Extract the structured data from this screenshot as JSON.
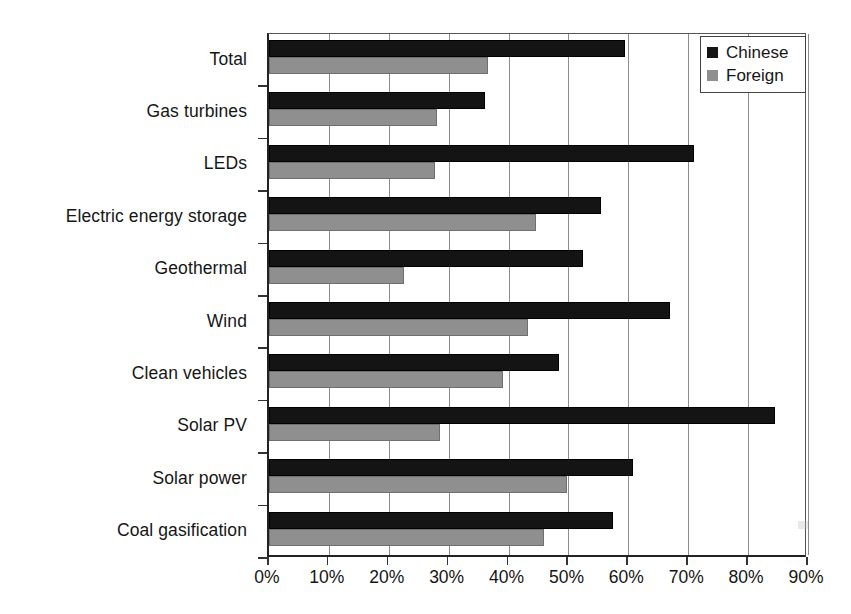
{
  "chart_data": {
    "type": "bar",
    "orientation": "horizontal",
    "title": "",
    "subtitle": "",
    "xlabel": "",
    "ylabel": "",
    "xlim": [
      0,
      90
    ],
    "xtick_step": 10,
    "xticks": [
      0,
      10,
      20,
      30,
      40,
      50,
      60,
      70,
      80,
      90
    ],
    "xtick_labels": [
      "0%",
      "10%",
      "20%",
      "30%",
      "40%",
      "50%",
      "60%",
      "70%",
      "80%",
      "90%"
    ],
    "grid": true,
    "grid_axis": "x",
    "legend_position": "top-right",
    "categories": [
      "Total",
      "Gas turbines",
      "LEDs",
      "Electric energy storage",
      "Geothermal",
      "Wind",
      "Clean vehicles",
      "Solar PV",
      "Solar power",
      "Coal gasification"
    ],
    "series": [
      {
        "name": "Chinese",
        "color": "#141414",
        "values": [
          59.5,
          36.0,
          71.0,
          55.5,
          52.5,
          67.0,
          48.5,
          84.5,
          60.8,
          57.5
        ]
      },
      {
        "name": "Foreign",
        "color": "#8f8f8f",
        "values": [
          36.5,
          28.0,
          27.7,
          44.5,
          22.6,
          43.3,
          39.0,
          28.5,
          49.8,
          46.0
        ]
      }
    ]
  },
  "legend": {
    "items": [
      {
        "label": "Chinese",
        "swatch": "black-square-swatch"
      },
      {
        "label": "Foreign",
        "swatch": "gray-square-swatch"
      }
    ]
  }
}
